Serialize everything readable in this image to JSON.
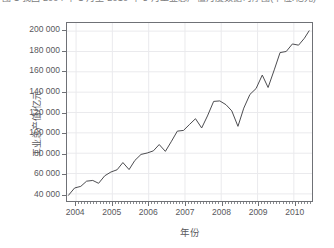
{
  "caption": {
    "text": "图 1  我国 2004 年 1 月至 2010 年 5 月工业总产值月度数据时序图(单位:亿元)"
  },
  "chart_data": {
    "type": "line",
    "title": "",
    "xlabel": "年份",
    "ylabel": "工业总产值/亿元",
    "grid": true,
    "legend": "none",
    "xlim": [
      2003.75,
      2010.5
    ],
    "ylim": [
      33000,
      208000
    ],
    "yticks": [
      40000,
      60000,
      80000,
      100000,
      120000,
      140000,
      160000,
      180000,
      200000
    ],
    "ytick_labels": [
      "40 000",
      "60 000",
      "80 000",
      "100 000",
      "120 000",
      "140 000",
      "160 000",
      "180 000",
      "200 000"
    ],
    "xticks": [
      2004,
      2005,
      2006,
      2007,
      2008,
      2009,
      2010
    ],
    "xtick_labels": [
      "2004",
      "2005",
      "2006",
      "2007",
      "2008",
      "2009",
      "2010"
    ],
    "line_color": "#4a4a4e",
    "series": [
      {
        "name": "工业总产值",
        "x": [
          2003.79,
          2003.96,
          2004.13,
          2004.29,
          2004.46,
          2004.62,
          2004.79,
          2004.96,
          2005.13,
          2005.29,
          2005.46,
          2005.62,
          2005.79,
          2005.96,
          2006.13,
          2006.29,
          2006.46,
          2006.62,
          2006.79,
          2006.96,
          2007.13,
          2007.29,
          2007.46,
          2007.62,
          2007.79,
          2007.96,
          2008.13,
          2008.29,
          2008.46,
          2008.62,
          2008.79,
          2008.96,
          2009.13,
          2009.29,
          2009.46,
          2009.62,
          2009.79,
          2009.96,
          2010.13,
          2010.29,
          2010.42
        ],
        "values": [
          38600,
          45800,
          47400,
          52500,
          53200,
          50400,
          57800,
          61500,
          63700,
          70800,
          63900,
          72900,
          78800,
          80200,
          82300,
          88500,
          81800,
          91200,
          101700,
          102400,
          108400,
          113900,
          104800,
          116600,
          130900,
          131400,
          127700,
          121600,
          106400,
          124300,
          137800,
          143600,
          156800,
          144600,
          161900,
          178900,
          180000,
          187400,
          186200,
          193000,
          200300
        ]
      }
    ]
  },
  "axes": {
    "y_title": "工业总产值/亿元",
    "x_title": "年份"
  }
}
